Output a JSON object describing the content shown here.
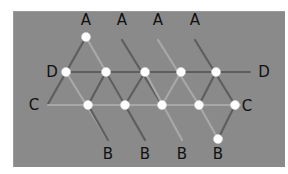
{
  "figure": {
    "colors": {
      "board": "#8a8a8a",
      "stick_dark": "#5e5e5e",
      "stick_light": "#a8a8a8",
      "node": "#ffffff",
      "label": "#111111"
    }
  },
  "labels": [
    {
      "text": "A",
      "x": 86,
      "y": 20
    },
    {
      "text": "A",
      "x": 122,
      "y": 20
    },
    {
      "text": "A",
      "x": 158,
      "y": 20
    },
    {
      "text": "A",
      "x": 195,
      "y": 20
    },
    {
      "text": "D",
      "x": 52,
      "y": 72
    },
    {
      "text": "D",
      "x": 264,
      "y": 72
    },
    {
      "text": "C",
      "x": 34,
      "y": 105
    },
    {
      "text": "C",
      "x": 247,
      "y": 106
    },
    {
      "text": "B",
      "x": 108,
      "y": 154
    },
    {
      "text": "B",
      "x": 145,
      "y": 154
    },
    {
      "text": "B",
      "x": 182,
      "y": 154
    },
    {
      "text": "B",
      "x": 218,
      "y": 154
    }
  ],
  "nodes": [
    {
      "x": 86,
      "y": 37
    },
    {
      "x": 66,
      "y": 72
    },
    {
      "x": 106,
      "y": 72
    },
    {
      "x": 145,
      "y": 72
    },
    {
      "x": 181,
      "y": 72
    },
    {
      "x": 216,
      "y": 72
    },
    {
      "x": 88,
      "y": 105
    },
    {
      "x": 125,
      "y": 105
    },
    {
      "x": 162,
      "y": 105
    },
    {
      "x": 199,
      "y": 105
    },
    {
      "x": 235,
      "y": 105
    },
    {
      "x": 218,
      "y": 139
    }
  ],
  "sticks": [
    {
      "x1": 86,
      "y1": 37,
      "x2": 48,
      "y2": 104,
      "tone": "dark"
    },
    {
      "x1": 86,
      "y1": 37,
      "x2": 125,
      "y2": 105,
      "tone": "light"
    },
    {
      "x1": 122,
      "y1": 40,
      "x2": 162,
      "y2": 105,
      "tone": "dark"
    },
    {
      "x1": 158,
      "y1": 40,
      "x2": 199,
      "y2": 105,
      "tone": "light"
    },
    {
      "x1": 195,
      "y1": 40,
      "x2": 235,
      "y2": 105,
      "tone": "dark"
    },
    {
      "x1": 66,
      "y1": 72,
      "x2": 250,
      "y2": 72,
      "tone": "dark"
    },
    {
      "x1": 48,
      "y1": 105,
      "x2": 240,
      "y2": 105,
      "tone": "light"
    },
    {
      "x1": 66,
      "y1": 72,
      "x2": 108,
      "y2": 140,
      "tone": "light"
    },
    {
      "x1": 106,
      "y1": 72,
      "x2": 88,
      "y2": 105,
      "tone": "dark"
    },
    {
      "x1": 106,
      "y1": 72,
      "x2": 145,
      "y2": 140,
      "tone": "dark"
    },
    {
      "x1": 145,
      "y1": 72,
      "x2": 125,
      "y2": 105,
      "tone": "dark"
    },
    {
      "x1": 145,
      "y1": 72,
      "x2": 182,
      "y2": 140,
      "tone": "light"
    },
    {
      "x1": 181,
      "y1": 72,
      "x2": 162,
      "y2": 105,
      "tone": "light"
    },
    {
      "x1": 216,
      "y1": 72,
      "x2": 199,
      "y2": 105,
      "tone": "dark"
    },
    {
      "x1": 88,
      "y1": 105,
      "x2": 108,
      "y2": 140,
      "tone": "dark"
    },
    {
      "x1": 235,
      "y1": 105,
      "x2": 218,
      "y2": 139,
      "tone": "dark"
    },
    {
      "x1": 199,
      "y1": 105,
      "x2": 218,
      "y2": 139,
      "tone": "light"
    }
  ]
}
